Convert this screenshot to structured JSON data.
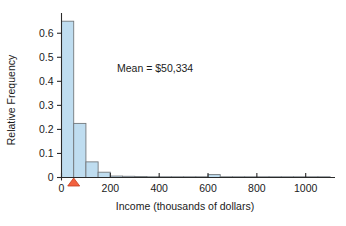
{
  "chart_data": {
    "type": "bar",
    "title": "",
    "subtitle": "",
    "xlabel": "Income (thousands of dollars)",
    "ylabel": "Relative Frequency",
    "xlim": [
      0,
      1120
    ],
    "ylim": [
      0,
      0.68
    ],
    "grid": false,
    "legend": null,
    "bin_width": 50,
    "x_ticks": [
      0,
      200,
      400,
      600,
      800,
      1000
    ],
    "x_tick_labels": [
      "0",
      "200",
      "400",
      "600",
      "800",
      "1000"
    ],
    "y_ticks": [
      0,
      0.1,
      0.2,
      0.3,
      0.4,
      0.5,
      0.6
    ],
    "y_tick_labels": [
      "0",
      "0.1",
      "0.2",
      "0.3",
      "0.4",
      "0.5",
      "0.6"
    ],
    "bin_edges": [
      0,
      50,
      100,
      150,
      200,
      250,
      300,
      350,
      400,
      450,
      500,
      550,
      600,
      650,
      700,
      750,
      800,
      850,
      900,
      950,
      1000,
      1050,
      1100
    ],
    "values": [
      0.65,
      0.225,
      0.065,
      0.022,
      0.006,
      0.005,
      0.004,
      0.003,
      0.002,
      0.002,
      0.001,
      0.001,
      0.012,
      0.001,
      0.001,
      0.001,
      0.001,
      0.0,
      0.0,
      0.0,
      0.0,
      0.0
    ],
    "bar_fill_color": "#bfddf0",
    "bar_edge_color": "#73787c",
    "annotations": [
      {
        "name": "mean-label",
        "text": "Mean = $50,334",
        "x_data": 300,
        "y_data": 0.41
      }
    ],
    "markers": [
      {
        "name": "mean-triangle-marker",
        "shape": "triangle-up",
        "x_data": 50,
        "y_data": 0,
        "color": "#f2613f",
        "edge_color": "#c43d1e"
      }
    ]
  },
  "axes": {
    "y_title": "Relative Frequency",
    "x_title": "Income (thousands of dollars)"
  }
}
